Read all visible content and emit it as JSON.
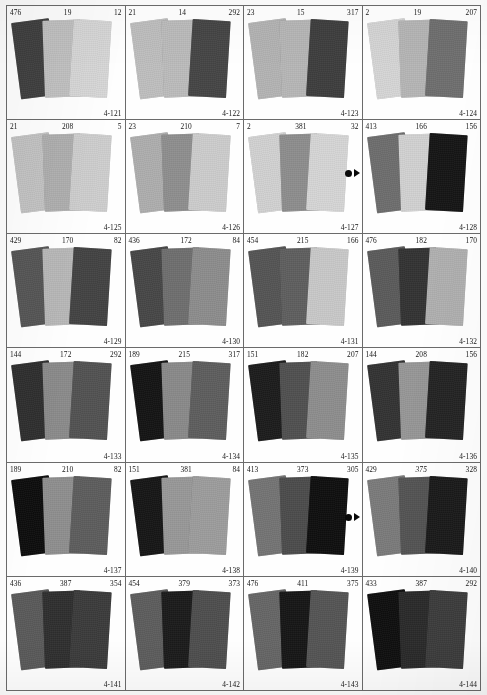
{
  "page": {
    "grid": {
      "columns": 4,
      "rows": 6
    }
  },
  "markers": [
    {
      "name": "registration-marker-row2",
      "left": 345,
      "top": 169
    },
    {
      "name": "registration-marker-row5",
      "left": 345,
      "top": 513
    }
  ],
  "cells": [
    {
      "code": "4-121",
      "numbers": {
        "left": "476",
        "center": "19",
        "right": "12"
      },
      "italic": {
        "left": false,
        "center": false,
        "right": false
      },
      "swatches": [
        "#3f3f3f",
        "#c2c2c2",
        "#d8d8d8"
      ]
    },
    {
      "code": "4-122",
      "numbers": {
        "left": "21",
        "center": "14",
        "right": "292"
      },
      "italic": {
        "left": false,
        "center": false,
        "right": false
      },
      "swatches": [
        "#bfbfbf",
        "#bcbcbc",
        "#454545"
      ]
    },
    {
      "code": "4-123",
      "numbers": {
        "left": "23",
        "center": "15",
        "right": "317"
      },
      "italic": {
        "left": false,
        "center": false,
        "right": false
      },
      "swatches": [
        "#b4b4b4",
        "#b7b7b7",
        "#3e3e3e"
      ]
    },
    {
      "code": "4-124",
      "numbers": {
        "left": "2",
        "center": "19",
        "right": "207"
      },
      "italic": {
        "left": false,
        "center": false,
        "right": false
      },
      "swatches": [
        "#d6d6d6",
        "#b6b6b6",
        "#6f6f6f"
      ]
    },
    {
      "code": "4-125",
      "numbers": {
        "left": "21",
        "center": "208",
        "right": "5"
      },
      "italic": {
        "left": false,
        "center": false,
        "right": false
      },
      "swatches": [
        "#c4c4c4",
        "#b0b0b0",
        "#cfcfcf"
      ]
    },
    {
      "code": "4-126",
      "numbers": {
        "left": "23",
        "center": "210",
        "right": "7"
      },
      "italic": {
        "left": false,
        "center": false,
        "right": false
      },
      "swatches": [
        "#aeaeae",
        "#8f8f8f",
        "#cdcdcd"
      ]
    },
    {
      "code": "4-127",
      "numbers": {
        "left": "2",
        "center": "381",
        "right": "32"
      },
      "italic": {
        "left": false,
        "center": false,
        "right": false
      },
      "swatches": [
        "#d2d2d2",
        "#8e8e8e",
        "#d6d6d6"
      ]
    },
    {
      "code": "4-128",
      "numbers": {
        "left": "413",
        "center": "166",
        "right": "156"
      },
      "italic": {
        "left": false,
        "center": false,
        "right": false
      },
      "swatches": [
        "#6e6e6e",
        "#d2d2d2",
        "#151515"
      ]
    },
    {
      "code": "4-129",
      "numbers": {
        "left": "429",
        "center": "170",
        "right": "82"
      },
      "italic": {
        "left": false,
        "center": false,
        "right": false
      },
      "swatches": [
        "#565656",
        "#b9b9b9",
        "#434343"
      ]
    },
    {
      "code": "4-130",
      "numbers": {
        "left": "436",
        "center": "172",
        "right": "84"
      },
      "italic": {
        "left": false,
        "center": false,
        "right": false
      },
      "swatches": [
        "#474747",
        "#6f6f6f",
        "#8d8d8d"
      ]
    },
    {
      "code": "4-131",
      "numbers": {
        "left": "454",
        "center": "215",
        "right": "166"
      },
      "italic": {
        "left": false,
        "center": false,
        "right": false
      },
      "swatches": [
        "#555555",
        "#5f5f5f",
        "#c9c9c9"
      ]
    },
    {
      "code": "4-132",
      "numbers": {
        "left": "476",
        "center": "182",
        "right": "170"
      },
      "italic": {
        "left": false,
        "center": false,
        "right": false
      },
      "swatches": [
        "#5b5b5b",
        "#333333",
        "#b1b1b1"
      ]
    },
    {
      "code": "4-133",
      "numbers": {
        "left": "144",
        "center": "172",
        "right": "292"
      },
      "italic": {
        "left": false,
        "center": false,
        "right": false
      },
      "swatches": [
        "#2e2e2e",
        "#8b8b8b",
        "#525252"
      ]
    },
    {
      "code": "4-134",
      "numbers": {
        "left": "189",
        "center": "215",
        "right": "317"
      },
      "italic": {
        "left": false,
        "center": false,
        "right": false
      },
      "swatches": [
        "#141414",
        "#8a8a8a",
        "#5e5e5e"
      ]
    },
    {
      "code": "4-135",
      "numbers": {
        "left": "151",
        "center": "182",
        "right": "207"
      },
      "italic": {
        "left": false,
        "center": false,
        "right": false
      },
      "swatches": [
        "#1c1c1c",
        "#505050",
        "#8e8e8e"
      ]
    },
    {
      "code": "4-136",
      "numbers": {
        "left": "144",
        "center": "208",
        "right": "156"
      },
      "italic": {
        "left": false,
        "center": false,
        "right": false
      },
      "swatches": [
        "#333333",
        "#979797",
        "#232323"
      ]
    },
    {
      "code": "4-137",
      "numbers": {
        "left": "189",
        "center": "210",
        "right": "82"
      },
      "italic": {
        "left": false,
        "center": false,
        "right": false
      },
      "swatches": [
        "#0d0d0d",
        "#8f8f8f",
        "#5d5d5d"
      ]
    },
    {
      "code": "4-138",
      "numbers": {
        "left": "151",
        "center": "381",
        "right": "84"
      },
      "italic": {
        "left": false,
        "center": false,
        "right": false
      },
      "swatches": [
        "#161616",
        "#989898",
        "#9d9d9d"
      ]
    },
    {
      "code": "4-139",
      "numbers": {
        "left": "413",
        "center": "373",
        "right": "305"
      },
      "italic": {
        "left": false,
        "center": false,
        "right": false
      },
      "swatches": [
        "#747474",
        "#4c4c4c",
        "#0f0f0f"
      ]
    },
    {
      "code": "4-140",
      "numbers": {
        "left": "429",
        "center": "375",
        "right": "328"
      },
      "italic": {
        "left": false,
        "center": true,
        "right": false
      },
      "swatches": [
        "#7b7b7b",
        "#545454",
        "#1a1a1a"
      ]
    },
    {
      "code": "4-141",
      "numbers": {
        "left": "436",
        "center": "387",
        "right": "354"
      },
      "italic": {
        "left": false,
        "center": false,
        "right": false
      },
      "swatches": [
        "#5a5a5a",
        "#2f2f2f",
        "#3b3b3b"
      ]
    },
    {
      "code": "4-142",
      "numbers": {
        "left": "454",
        "center": "379",
        "right": "373"
      },
      "italic": {
        "left": false,
        "center": false,
        "right": false
      },
      "swatches": [
        "#5d5d5d",
        "#1b1b1b",
        "#4e4e4e"
      ]
    },
    {
      "code": "4-143",
      "numbers": {
        "left": "476",
        "center": "411",
        "right": "375"
      },
      "italic": {
        "left": false,
        "center": false,
        "right": false
      },
      "swatches": [
        "#666666",
        "#161616",
        "#555555"
      ]
    },
    {
      "code": "4-144",
      "numbers": {
        "left": "433",
        "center": "387",
        "right": "292"
      },
      "italic": {
        "left": false,
        "center": false,
        "right": false
      },
      "swatches": [
        "#0f0f0f",
        "#2a2a2a",
        "#3d3d3d"
      ]
    }
  ]
}
